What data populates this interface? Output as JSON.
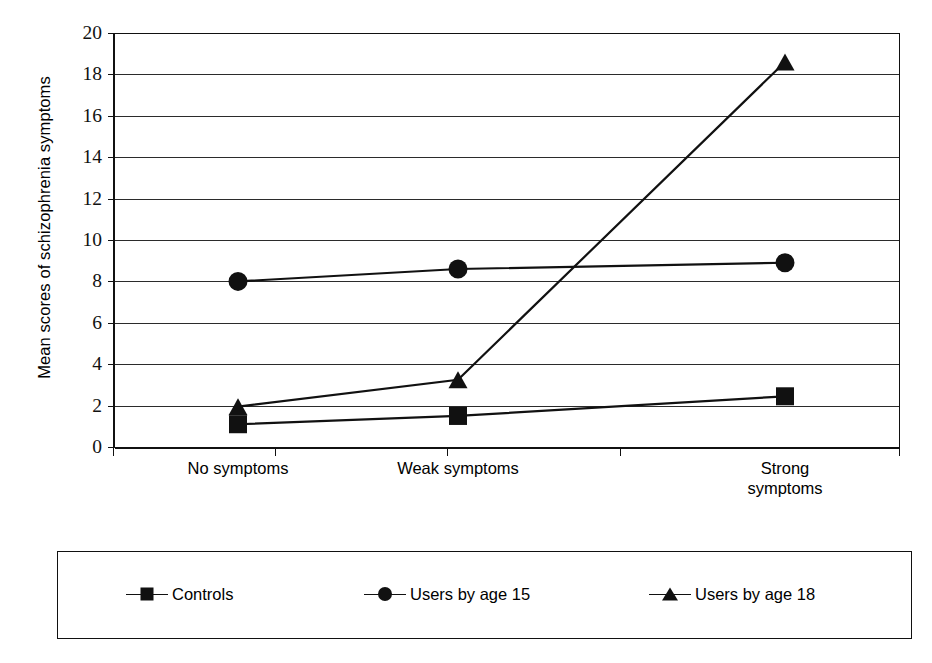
{
  "chart_data": {
    "type": "line",
    "title": "",
    "xlabel": "",
    "ylabel": "Mean scores of schizophrenia symptoms",
    "categories": [
      "No symptoms",
      "Weak symptoms",
      "Strong symptoms"
    ],
    "category_label_lines": [
      [
        "No symptoms"
      ],
      [
        "Weak symptoms"
      ],
      [
        "Strong",
        "symptoms"
      ]
    ],
    "ylim": [
      0,
      20
    ],
    "ytick_step": 2,
    "yticks": [
      0,
      2,
      4,
      6,
      8,
      10,
      12,
      14,
      16,
      18,
      20
    ],
    "ytick_labels": [
      "0",
      "2",
      "4",
      "6",
      "8",
      "10",
      "12",
      "14",
      "16",
      "18",
      "20"
    ],
    "grid": true,
    "grid_axis": "y",
    "legend_position": "bottom",
    "series": [
      {
        "name": "Controls",
        "marker": "square",
        "color": "#111111",
        "values": [
          1.1,
          1.5,
          2.45
        ]
      },
      {
        "name": "Users by age 15",
        "marker": "circle",
        "color": "#111111",
        "values": [
          8.0,
          8.6,
          8.9
        ]
      },
      {
        "name": "Users by age 18",
        "marker": "triangle",
        "color": "#111111",
        "values": [
          1.95,
          3.25,
          18.6
        ]
      }
    ]
  },
  "legend": {
    "items": [
      {
        "label": "Controls",
        "marker": "square-marker-icon"
      },
      {
        "label": "Users by age 15",
        "marker": "circle-marker-icon"
      },
      {
        "label": "Users by age 18",
        "marker": "triangle-marker-icon"
      }
    ]
  }
}
